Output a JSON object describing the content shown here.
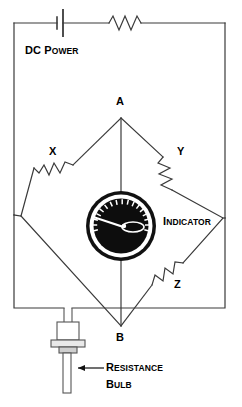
{
  "diagram": {
    "background_color": "#ffffff",
    "line_color": "#3a3a3a",
    "text_color": "#000000",
    "gauge_face_color": "#0d0d0d",
    "gauge_ring_color": "#ffffff",
    "gauge_outer_color": "#111111",
    "needle_color": "#ffffff"
  },
  "labels": {
    "dc_power": {
      "cap": "DC",
      "rest": " P",
      "small": "OWER"
    },
    "indicator": {
      "cap": "I",
      "small": "NDICATOR"
    },
    "resistance_bulb_line1": {
      "cap": "R",
      "small": "ESISTANCE"
    },
    "resistance_bulb_line2": {
      "cap": "B",
      "small": "ULB"
    },
    "node_a": "A",
    "node_b": "B",
    "resistor_x": "X",
    "resistor_y": "Y",
    "resistor_z": "Z"
  },
  "components": {
    "battery": {
      "name": "DC Power",
      "symbol": "battery-cell"
    },
    "series_resistor": {
      "name": "Series Resistor",
      "symbol": "zigzag-resistor",
      "peaks": 4
    },
    "resistor_x": {
      "name": "Resistor X",
      "symbol": "zigzag-resistor",
      "arm": "upper-left"
    },
    "resistor_y": {
      "name": "Resistor Y",
      "symbol": "zigzag-resistor",
      "arm": "upper-right"
    },
    "resistor_z": {
      "name": "Resistor Z",
      "symbol": "zigzag-resistor",
      "arm": "lower-right"
    },
    "indicator": {
      "name": "Indicator Meter",
      "symbol": "analog-gauge",
      "tick_count": 17,
      "needle_direction": "upper-left"
    },
    "resistance_bulb": {
      "name": "Resistance Bulb",
      "symbol": "probe-sensor"
    }
  },
  "nodes": [
    {
      "id": "A",
      "label": "A",
      "position": "top"
    },
    {
      "id": "B",
      "label": "B",
      "position": "bottom"
    }
  ]
}
